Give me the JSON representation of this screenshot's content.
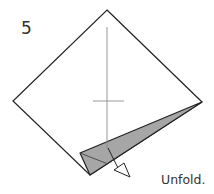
{
  "diagram": {
    "step_number": "5",
    "caption": "Unfold.",
    "colors": {
      "outline": "#222222",
      "crease": "#999999",
      "flap_fill": "#a6a6a6"
    },
    "icons": {
      "arrow": "hollow-push-arrow"
    }
  }
}
